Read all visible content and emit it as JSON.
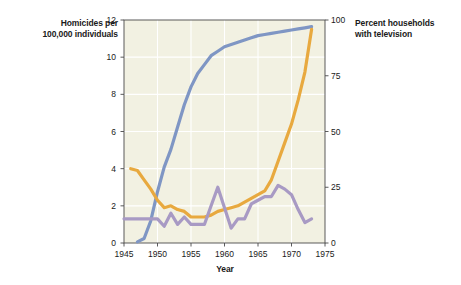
{
  "chart_data": {
    "type": "line",
    "title": "",
    "xlabel": "Year",
    "ylabel_left": "Homicides per\n100,000 individuals",
    "ylabel_right": "Percent households\nwith television",
    "xlim": [
      1945,
      1975
    ],
    "ylim_left": [
      0,
      12
    ],
    "ylim_right": [
      0,
      100
    ],
    "xticks": [
      "1945",
      "1950",
      "1955",
      "1960",
      "1965",
      "1970",
      "1975"
    ],
    "yticks_left": [
      "0",
      "2",
      "4",
      "6",
      "8",
      "10",
      "12"
    ],
    "yticks_right": [
      "0",
      "25",
      "50",
      "75",
      "100"
    ],
    "grid": true,
    "legend_position": "inline-annotations",
    "plot_background": "#f2f1e2",
    "series": [
      {
        "name": "Television ownership, United States",
        "axis": "right",
        "color": "#7f96c4",
        "annotation": "Television ownership,\nUnited States",
        "x": [
          1947,
          1948,
          1949,
          1950,
          1951,
          1952,
          1953,
          1954,
          1955,
          1956,
          1957,
          1958,
          1959,
          1960,
          1961,
          1962,
          1963,
          1964,
          1965,
          1966,
          1967,
          1968,
          1969,
          1970,
          1971,
          1972,
          1973
        ],
        "values": [
          0.5,
          2,
          10,
          23,
          34,
          42,
          52,
          62,
          70,
          76,
          80,
          84,
          86,
          88,
          89,
          90,
          91,
          92,
          93,
          93.5,
          94,
          94.5,
          95,
          95.5,
          96,
          96.5,
          97
        ]
      },
      {
        "name": "Homicides, United States (Caucasians)",
        "axis": "left",
        "color": "#e8a93f",
        "annotation": "Homicides,\nUnited States\n(Caucasians)",
        "x": [
          1946,
          1947,
          1948,
          1949,
          1950,
          1951,
          1952,
          1953,
          1954,
          1955,
          1956,
          1957,
          1958,
          1959,
          1960,
          1961,
          1962,
          1963,
          1964,
          1965,
          1966,
          1967,
          1968,
          1969,
          1970,
          1971,
          1972,
          1973
        ],
        "values": [
          4.0,
          3.9,
          3.4,
          2.9,
          2.3,
          1.9,
          2.0,
          1.8,
          1.7,
          1.4,
          1.4,
          1.4,
          1.5,
          1.7,
          1.8,
          1.9,
          2.0,
          2.2,
          2.4,
          2.6,
          2.8,
          3.4,
          4.4,
          5.4,
          6.4,
          7.7,
          9.2,
          11.5
        ]
      },
      {
        "name": "Homicides, South Africa (Caucasians)",
        "axis": "left",
        "color": "#a89ac4",
        "annotation": "Homicides,\nSouth Africa\n(Caucasians)",
        "x": [
          1945,
          1946,
          1947,
          1948,
          1949,
          1950,
          1951,
          1952,
          1953,
          1954,
          1955,
          1956,
          1957,
          1958,
          1959,
          1960,
          1961,
          1962,
          1963,
          1964,
          1965,
          1966,
          1967,
          1968,
          1969,
          1970,
          1971,
          1972,
          1973
        ],
        "values": [
          1.3,
          1.3,
          1.3,
          1.3,
          1.3,
          1.3,
          0.9,
          1.6,
          1.0,
          1.4,
          1.0,
          1.0,
          1.0,
          2.0,
          3.0,
          1.9,
          0.8,
          1.3,
          1.3,
          2.1,
          2.3,
          2.5,
          2.5,
          3.1,
          2.9,
          2.6,
          1.8,
          1.1,
          1.3
        ]
      }
    ]
  }
}
